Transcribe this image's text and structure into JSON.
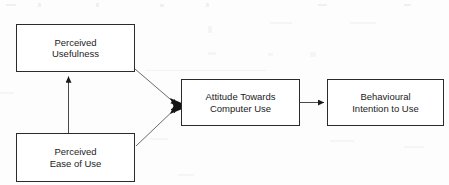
{
  "diagram": {
    "type": "flow-diagram",
    "top_cut_text": "",
    "line_color": "#2b2b2b",
    "box_fill": "#ffffff",
    "text_color": "#1c1c1c",
    "background": "#fdfdfd",
    "nodes": [
      {
        "id": "perceived-usefulness",
        "line1": "Perceived",
        "line2": "Usefulness",
        "x": 16,
        "y": 24,
        "w": 119,
        "h": 48
      },
      {
        "id": "perceived-ease-of-use",
        "line1": "Perceived",
        "line2": "Ease of Use",
        "x": 16,
        "y": 133,
        "w": 119,
        "h": 49
      },
      {
        "id": "attitude-towards-computer-use",
        "line1": "Attitude Towards",
        "line2": "Computer Use",
        "x": 181,
        "y": 79,
        "w": 119,
        "h": 47
      },
      {
        "id": "behavioural-intention-to-use",
        "line1": "Behavioural",
        "line2": "Intention to Use",
        "x": 327,
        "y": 79,
        "w": 117,
        "h": 47
      }
    ],
    "edges": [
      {
        "id": "ease-of-use-to-usefulness",
        "from": "perceived-ease-of-use",
        "to": "perceived-usefulness",
        "style": "straight-vertical",
        "arrowhead": "filled-triangle"
      },
      {
        "id": "usefulness-to-attitude",
        "from": "perceived-usefulness",
        "to": "attitude-towards-computer-use",
        "style": "diagonal",
        "arrowhead": "filled-triangle"
      },
      {
        "id": "ease-of-use-to-attitude",
        "from": "perceived-ease-of-use",
        "to": "attitude-towards-computer-use",
        "style": "diagonal",
        "arrowhead": "filled-triangle"
      },
      {
        "id": "attitude-to-intention",
        "from": "attitude-towards-computer-use",
        "to": "behavioural-intention-to-use",
        "style": "straight-horizontal",
        "arrowhead": "filled-triangle"
      }
    ]
  }
}
